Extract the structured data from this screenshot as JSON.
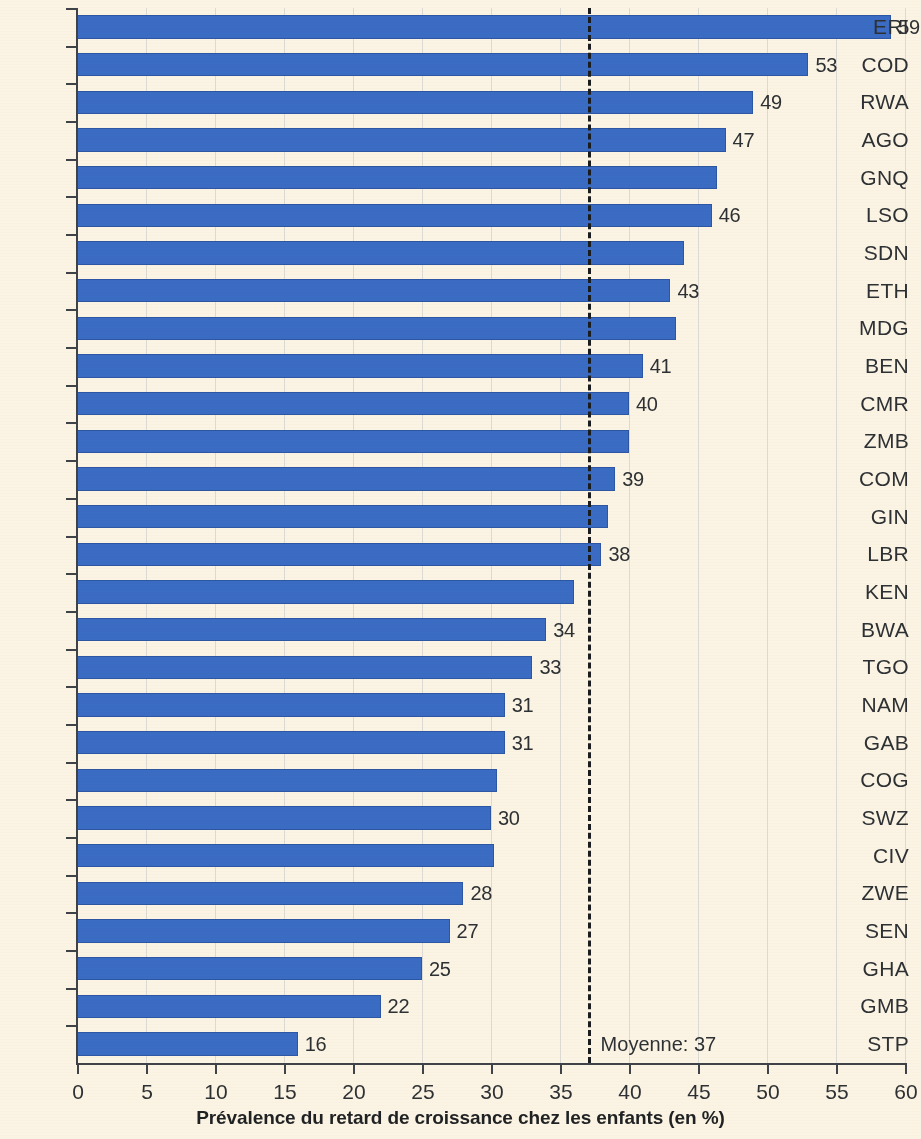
{
  "chart_data": {
    "type": "bar",
    "orientation": "horizontal",
    "title": "",
    "xlabel": "Prévalence du retard de croissance chez les enfants (en %)",
    "ylabel": "",
    "xlim": [
      0,
      60
    ],
    "xticks": [
      0,
      5,
      10,
      15,
      20,
      25,
      30,
      35,
      40,
      45,
      50,
      55,
      60
    ],
    "grid": true,
    "grid_axis": "x",
    "bar_color": "#3b6cc3",
    "background_color": "#fbf4e4",
    "text_color": "#2e3134",
    "categories": [
      "ERI",
      "COD",
      "RWA",
      "AGO",
      "GNQ",
      "LSO",
      "SDN",
      "ETH",
      "MDG",
      "BEN",
      "CMR",
      "ZMB",
      "COM",
      "GIN",
      "LBR",
      "KEN",
      "BWA",
      "TGO",
      "NAM",
      "GAB",
      "COG",
      "SWZ",
      "CIV",
      "ZWE",
      "SEN",
      "GHA",
      "GMB",
      "STP"
    ],
    "values": [
      59,
      53,
      49,
      47,
      46.4,
      46,
      44,
      43,
      43.4,
      41,
      40,
      40,
      39,
      38.5,
      38,
      36,
      34,
      33,
      31,
      31,
      30.4,
      30,
      30.2,
      28,
      27,
      25,
      22,
      16
    ],
    "bar_labels": [
      "59",
      "53",
      "49",
      "47",
      "",
      "46",
      "",
      "43",
      "",
      "41",
      "40",
      "",
      "39",
      "",
      "38",
      "",
      "34",
      "33",
      "31",
      "31",
      "",
      "30",
      "",
      "28",
      "27",
      "25",
      "22",
      "16"
    ],
    "annotations": [
      {
        "name": "mean-line",
        "label": "Moyenne: 37",
        "value": 37,
        "style": "dashed-vertical",
        "color": "#1b1c1e"
      }
    ]
  },
  "axis": {
    "x_title": "Prévalence du retard de croissance chez les enfants (en %)"
  },
  "mean": {
    "label": "Moyenne: 37"
  }
}
